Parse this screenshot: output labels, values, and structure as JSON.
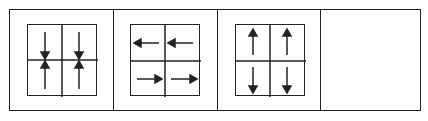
{
  "figure": {
    "panels": [
      {
        "id": 1,
        "description": "2x2 grid; arrows converge vertically toward the center line (top cells point down, bottom cells point up)",
        "top_row": [
          "down",
          "down"
        ],
        "bottom_row": [
          "up",
          "up"
        ]
      },
      {
        "id": 2,
        "description": "2x2 grid; top row arrows point left, bottom row arrows point right",
        "top_row": [
          "left",
          "left"
        ],
        "bottom_row": [
          "right",
          "right"
        ]
      },
      {
        "id": 3,
        "description": "2x2 grid; top row arrows point up, bottom row arrows point down (diverging)",
        "top_row": [
          "up",
          "up"
        ],
        "bottom_row": [
          "down",
          "down"
        ]
      },
      {
        "id": 4,
        "description": "empty panel (answer slot)",
        "top_row": [],
        "bottom_row": []
      }
    ],
    "stroke_color": "#222222",
    "background": "#ffffff"
  }
}
